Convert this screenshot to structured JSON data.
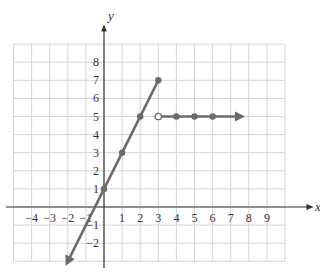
{
  "chart_data": {
    "type": "line",
    "title": "",
    "xlabel": "x",
    "ylabel": "y",
    "xlim": [
      -5,
      10
    ],
    "ylim": [
      -3,
      9
    ],
    "grid": true,
    "x_ticks": [
      "-4",
      "-3",
      "-2",
      "-1",
      "1",
      "2",
      "3",
      "4",
      "5",
      "6",
      "7",
      "8",
      "9"
    ],
    "y_ticks": [
      "-2",
      "-1",
      "1",
      "2",
      "3",
      "4",
      "5",
      "6",
      "7",
      "8"
    ],
    "series": [
      {
        "name": "piece-1 (y = 2x + 1, x ≤ 3)",
        "points": [
          [
            0,
            1
          ],
          [
            1,
            3
          ],
          [
            2,
            5
          ],
          [
            3,
            7
          ]
        ],
        "arrow_toward": [
          -2,
          -3
        ],
        "endpoint": {
          "x": 3,
          "y": 7,
          "closed": true
        }
      },
      {
        "name": "piece-2 (y = 5, x > 3)",
        "points": [
          [
            4,
            5
          ],
          [
            5,
            5
          ],
          [
            6,
            5
          ]
        ],
        "start": {
          "x": 3,
          "y": 5,
          "closed": false
        },
        "arrow_toward": [
          7.5,
          5
        ]
      }
    ],
    "colors": {
      "line": "#6b6b6b",
      "grid": "#d4d4d4",
      "axis": "#333333"
    }
  }
}
